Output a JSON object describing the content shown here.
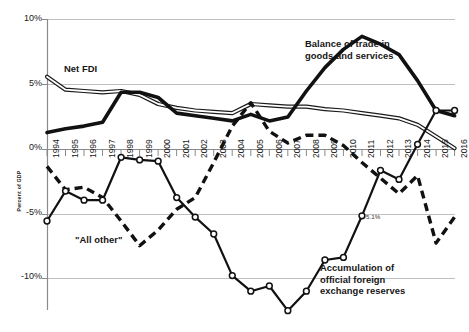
{
  "chart_data": {
    "type": "line",
    "title": "",
    "xlabel": "",
    "ylabel": "Percent of GDP",
    "ylim": [
      -15,
      10
    ],
    "xlim": [
      1994,
      2016
    ],
    "grid": true,
    "legend": "annotations-inline",
    "yticks": [
      "10%",
      "5%",
      "0%",
      "-5%",
      "-10%"
    ],
    "ytick_values": [
      10,
      5,
      0,
      -5,
      -10
    ],
    "categories": [
      1994,
      1995,
      1996,
      1997,
      1998,
      1999,
      2000,
      2001,
      2002,
      2003,
      2004,
      2005,
      2006,
      2007,
      2008,
      2009,
      2010,
      2011,
      2012,
      2013,
      2014,
      2015,
      2016
    ],
    "xtick_labels": [
      "1994",
      "1995",
      "1996",
      "1997",
      "1998",
      "1999",
      "2000",
      "2001",
      "2002",
      "2003",
      "2004",
      "2005",
      "2006",
      "2007",
      "2008",
      "2009",
      "2010",
      "2011",
      "2012",
      "2013",
      "2014",
      "2015",
      "2016"
    ],
    "series": [
      {
        "name": "Net FDI",
        "style": "double-line",
        "color": "#1a1a1a",
        "values": [
          5.6,
          4.6,
          4.5,
          4.4,
          4.5,
          4.2,
          3.5,
          3.2,
          3.0,
          2.9,
          2.8,
          3.5,
          3.4,
          3.3,
          3.3,
          3.1,
          3.0,
          2.8,
          2.6,
          2.4,
          1.9,
          1.0,
          0.1
        ]
      },
      {
        "name": "Balance of trade in goods and services",
        "style": "thick-solid",
        "color": "#111111",
        "values": [
          1.3,
          1.6,
          1.8,
          2.1,
          4.4,
          4.4,
          4.0,
          2.8,
          2.6,
          2.4,
          2.2,
          2.7,
          2.2,
          2.5,
          4.5,
          6.3,
          7.7,
          8.7,
          8.1,
          7.3,
          5.3,
          3.0,
          2.6
        ]
      },
      {
        "name": "\"All other\"",
        "style": "dashed",
        "color": "#111111",
        "values": [
          -1.3,
          -3.1,
          -2.9,
          -3.7,
          -5.5,
          -7.4,
          -6.2,
          -4.6,
          -3.7,
          -1.0,
          1.8,
          3.6,
          1.4,
          0.5,
          1.1,
          1.1,
          0.3,
          -1.0,
          -2.2,
          -3.4,
          -2.0,
          -7.2,
          -5.2
        ]
      },
      {
        "name": "Accumulation of official foreign exchange reserves",
        "style": "solid-marker",
        "color": "#111111",
        "values": [
          -5.5,
          -3.2,
          -3.9,
          -3.9,
          -0.6,
          -0.8,
          -0.9,
          -3.7,
          -5.2,
          -6.5,
          -9.7,
          -10.9,
          -10.5,
          -12.4,
          -10.9,
          -8.5,
          -8.3,
          -5.1,
          -1.6,
          -2.3,
          0.4,
          3.0,
          3.0
        ]
      }
    ],
    "data_labels": [
      {
        "series": "Accumulation of official foreign exchange reserves",
        "x": 2011,
        "y": -5.1,
        "text": "-5.1%"
      }
    ],
    "annotations": [
      {
        "id": "net-fdi",
        "text": "Net FDI"
      },
      {
        "id": "trade",
        "text": "Balance of trade in\ngoods and services"
      },
      {
        "id": "allother",
        "text": "\"All other\""
      },
      {
        "id": "reserves",
        "text": "Accumulation of\nofficial foreign\nexchange reserves"
      }
    ]
  },
  "axis": {
    "y_label": "Percent of GDP",
    "y_ticks": [
      "10%",
      "5%",
      "0%",
      "-5%",
      "-10%"
    ]
  },
  "caption": {
    "text": ""
  }
}
